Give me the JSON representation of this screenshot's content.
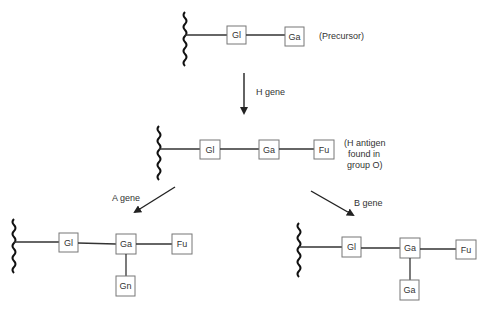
{
  "structures": {
    "precursor": {
      "label": "(Precursor)",
      "sugars": [
        "Gl",
        "Ga"
      ]
    },
    "h_antigen": {
      "label_lines": [
        "(H antigen",
        "found in",
        "group O)"
      ],
      "sugars": [
        "Gl",
        "Ga",
        "Fu"
      ]
    },
    "a_antigen": {
      "sugars": [
        "Gl",
        "Ga",
        "Fu"
      ],
      "branch": "Gn"
    },
    "b_antigen": {
      "sugars": [
        "Gl",
        "Ga",
        "Fu"
      ],
      "branch": "Ga"
    }
  },
  "arrows": {
    "h_gene": "H gene",
    "a_gene": "A gene",
    "b_gene": "B gene"
  }
}
